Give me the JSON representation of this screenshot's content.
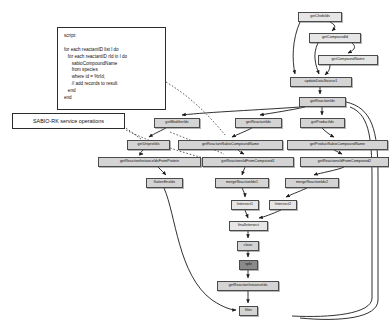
{
  "diagram": {
    "canvas": {
      "width": 389,
      "height": 331,
      "background": "#ffffff"
    },
    "colors": {
      "node_fill": "#d4d4d4",
      "node_fill_light": "#e6e6e6",
      "node_fill_dark": "#8a8a8a",
      "node_border": "#4a4a4a",
      "edge": "#1a1a1a",
      "annotation_border": "#2c2c2c"
    }
  },
  "annotations": {
    "script_box": {
      "name": "script-annotation",
      "text": "script:\n\nfor each reactantID list l do\n   for each reactantID rId in l do\n      sabioCompoundName\n      from species\n      where id = %rId;\n      // add records to result\n   end\nend",
      "x": 57,
      "y": 27,
      "width": 109,
      "height": 83
    },
    "service_label": {
      "name": "service-operations-label",
      "text": "SABIO-RK service operations",
      "x": 12,
      "y": 113,
      "width": 113,
      "height": 16
    }
  },
  "nodes": [
    {
      "id": "getChebiIds",
      "label": "getChebiIds",
      "x": 298,
      "y": 12,
      "width": 44,
      "height": 10,
      "style": "light"
    },
    {
      "id": "getCompoundId",
      "label": "getCompoundId",
      "x": 309,
      "y": 33,
      "width": 52,
      "height": 10,
      "style": "light"
    },
    {
      "id": "getCompoundName",
      "label": "getCompoundName",
      "x": 318,
      "y": 55,
      "width": 60,
      "height": 10,
      "style": "light"
    },
    {
      "id": "updateDataSource1",
      "label": "updateDataSource1",
      "x": 290,
      "y": 77,
      "width": 62,
      "height": 10,
      "style": "normal"
    },
    {
      "id": "getReactionIds",
      "label": "getReactionIds",
      "x": 299,
      "y": 97,
      "width": 47,
      "height": 10,
      "style": "normal"
    },
    {
      "id": "getModifierIds",
      "label": "getModifierIds",
      "x": 154,
      "y": 118,
      "width": 46,
      "height": 10,
      "style": "normal"
    },
    {
      "id": "getReactantIds",
      "label": "getReactantIds",
      "x": 235,
      "y": 118,
      "width": 47,
      "height": 10,
      "style": "normal"
    },
    {
      "id": "getProductIds",
      "label": "getProductIds",
      "x": 300,
      "y": 118,
      "width": 45,
      "height": 10,
      "style": "normal"
    },
    {
      "id": "getUniprotIds",
      "label": "getUniprotIds",
      "x": 127,
      "y": 140,
      "width": 43,
      "height": 10,
      "style": "normal"
    },
    {
      "id": "getReactantSabioCompoundName",
      "label": "getReactantSabioCompoundName",
      "x": 178,
      "y": 140,
      "width": 105,
      "height": 10,
      "style": "normal"
    },
    {
      "id": "getProductSabioCompoundName",
      "label": "getProductSabioCompoundName",
      "x": 287,
      "y": 140,
      "width": 101,
      "height": 10,
      "style": "normal"
    },
    {
      "id": "getReactionInstanceIdsFromProtein",
      "label": "getReactionInstanceIdsFromProtein",
      "x": 98,
      "y": 157,
      "width": 103,
      "height": 10,
      "style": "normal"
    },
    {
      "id": "getReactionsIdFromCompound1",
      "label": "getReactionsIdFromCompound1",
      "x": 202,
      "y": 157,
      "width": 92,
      "height": 10,
      "style": "normal"
    },
    {
      "id": "getReactionsIdFromCompound2",
      "label": "getReactionsIdFromCompound2",
      "x": 300,
      "y": 157,
      "width": 89,
      "height": 10,
      "style": "normal"
    },
    {
      "id": "flattenEnzIds",
      "label": "flattenEnzIds",
      "x": 146,
      "y": 178,
      "width": 37,
      "height": 10,
      "style": "normal"
    },
    {
      "id": "mergeReactionIds1",
      "label": "mergeReactionIds1",
      "x": 215,
      "y": 178,
      "width": 54,
      "height": 10,
      "style": "normal"
    },
    {
      "id": "mergeReactionIds2",
      "label": "mergeReactionIds2",
      "x": 285,
      "y": 178,
      "width": 54,
      "height": 10,
      "style": "normal"
    },
    {
      "id": "Intersect1",
      "label": "Intersect1",
      "x": 231,
      "y": 200,
      "width": 28,
      "height": 10,
      "style": "light"
    },
    {
      "id": "Intersect2",
      "label": "Intersect2",
      "x": 269,
      "y": 200,
      "width": 28,
      "height": 10,
      "style": "light"
    },
    {
      "id": "finalIntersect",
      "label": "finalIntersect",
      "x": 229,
      "y": 221,
      "width": 39,
      "height": 10,
      "style": "light"
    },
    {
      "id": "clean",
      "label": "clean",
      "x": 237,
      "y": 241,
      "width": 22,
      "height": 10,
      "style": "normal"
    },
    {
      "id": "split",
      "label": "split",
      "x": 239,
      "y": 260,
      "width": 19,
      "height": 10,
      "style": "dark"
    },
    {
      "id": "getReactionInstanceIds",
      "label": "getReactionInstanceIds",
      "x": 217,
      "y": 281,
      "width": 62,
      "height": 10,
      "style": "normal"
    },
    {
      "id": "filter",
      "label": "filter",
      "x": 239,
      "y": 306,
      "width": 19,
      "height": 10,
      "style": "normal"
    }
  ],
  "edges": [
    {
      "from": "getChebiIds",
      "to": "getCompoundId"
    },
    {
      "from": "getChebiIds",
      "to": "updateDataSource1"
    },
    {
      "from": "getCompoundId",
      "to": "getCompoundName"
    },
    {
      "from": "getCompoundId",
      "to": "updateDataSource1"
    },
    {
      "from": "getCompoundName",
      "to": "updateDataSource1"
    },
    {
      "from": "updateDataSource1",
      "to": "getReactionIds"
    },
    {
      "from": "getReactionIds",
      "to": "getModifierIds"
    },
    {
      "from": "getReactionIds",
      "to": "getReactantIds"
    },
    {
      "from": "getReactionIds",
      "to": "getProductIds"
    },
    {
      "from": "getModifierIds",
      "to": "getUniprotIds"
    },
    {
      "from": "getReactantIds",
      "to": "getReactantSabioCompoundName"
    },
    {
      "from": "getProductIds",
      "to": "getProductSabioCompoundName"
    },
    {
      "from": "getUniprotIds",
      "to": "getReactionInstanceIdsFromProtein"
    },
    {
      "from": "getReactantSabioCompoundName",
      "to": "getReactionsIdFromCompound1"
    },
    {
      "from": "getProductSabioCompoundName",
      "to": "getReactionsIdFromCompound2"
    },
    {
      "from": "getReactionInstanceIdsFromProtein",
      "to": "flattenEnzIds"
    },
    {
      "from": "getReactionsIdFromCompound1",
      "to": "mergeReactionIds1"
    },
    {
      "from": "getReactionsIdFromCompound2",
      "to": "mergeReactionIds2"
    },
    {
      "from": "mergeReactionIds1",
      "to": "Intersect1"
    },
    {
      "from": "mergeReactionIds2",
      "to": "Intersect2"
    },
    {
      "from": "Intersect1",
      "to": "finalIntersect"
    },
    {
      "from": "Intersect2",
      "to": "finalIntersect"
    },
    {
      "from": "finalIntersect",
      "to": "clean"
    },
    {
      "from": "clean",
      "to": "split"
    },
    {
      "from": "split",
      "to": "getReactionInstanceIds"
    },
    {
      "from": "getReactionInstanceIds",
      "to": "filter"
    },
    {
      "from": "flattenEnzIds",
      "to": "filter"
    }
  ],
  "dashed_edges": [
    {
      "from": "script_box",
      "to": "getReactantSabioCompoundName"
    },
    {
      "from": "service_label",
      "to": "getUniprotIds"
    },
    {
      "from": "service_label",
      "to": "getReactionsIdFromCompound1"
    }
  ]
}
